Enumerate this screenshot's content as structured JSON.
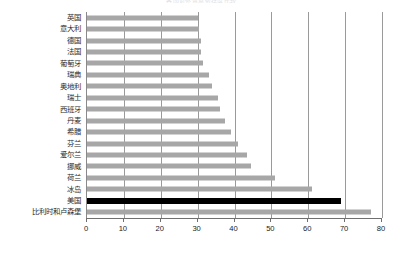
{
  "chart_data": {
    "type": "bar",
    "orientation": "horizontal",
    "title": "各国对外贸易依存度比较",
    "xlabel": "",
    "ylabel": "",
    "xlim": [
      0,
      80
    ],
    "xticks": [
      0,
      10,
      20,
      30,
      40,
      50,
      60,
      70,
      80
    ],
    "grid": true,
    "grid_axis": "x",
    "legend": "none",
    "bar_color": "#a7a7a7",
    "highlight_color": "#000000",
    "highlight_category": "美国",
    "categories": [
      "英国",
      "意大利",
      "德国",
      "法国",
      "葡萄牙",
      "瑞典",
      "奥地利",
      "瑞士",
      "西班牙",
      "丹麦",
      "希腊",
      "芬兰",
      "爱尔兰",
      "挪威",
      "荷兰",
      "冰岛",
      "美国",
      "比利时和卢森堡"
    ],
    "values": [
      30,
      30.5,
      31,
      31,
      31.5,
      33,
      34,
      35.5,
      36,
      37.5,
      39,
      41,
      43.5,
      44.5,
      51,
      61,
      69,
      77
    ]
  }
}
